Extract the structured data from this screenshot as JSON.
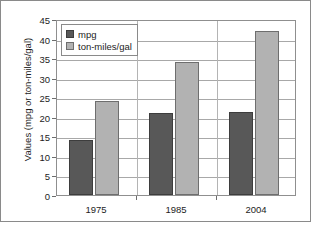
{
  "chart_data": {
    "type": "bar",
    "title": "",
    "subtitle": "",
    "xlabel": "",
    "ylabel": "Values (mpg or ton-miles/gal)",
    "categories": [
      "1975",
      "1985",
      "2004"
    ],
    "series": [
      {
        "name": "mpg",
        "values": [
          14,
          21,
          21.2
        ],
        "color": "#585858"
      },
      {
        "name": "ton-miles/gal",
        "values": [
          24,
          34,
          42
        ],
        "color": "#b2b2b2"
      }
    ],
    "ylim": [
      0,
      45
    ],
    "ytick_step": 5,
    "yticks": [
      "45",
      "40",
      "35",
      "30",
      "25",
      "20",
      "15",
      "10",
      "5",
      "0"
    ],
    "grid": "horizontal",
    "legend_position": "top-left",
    "legend_entries": [
      "mpg",
      "ton-miles/gal"
    ],
    "annotations": []
  },
  "figure": {
    "plot_border_color": "#8f8f8f",
    "grid_color": "#a8a8a8",
    "outer_frame_color": "#8a8a8a",
    "background_color": "#ffffff",
    "text_color": "#1d1d1d"
  }
}
